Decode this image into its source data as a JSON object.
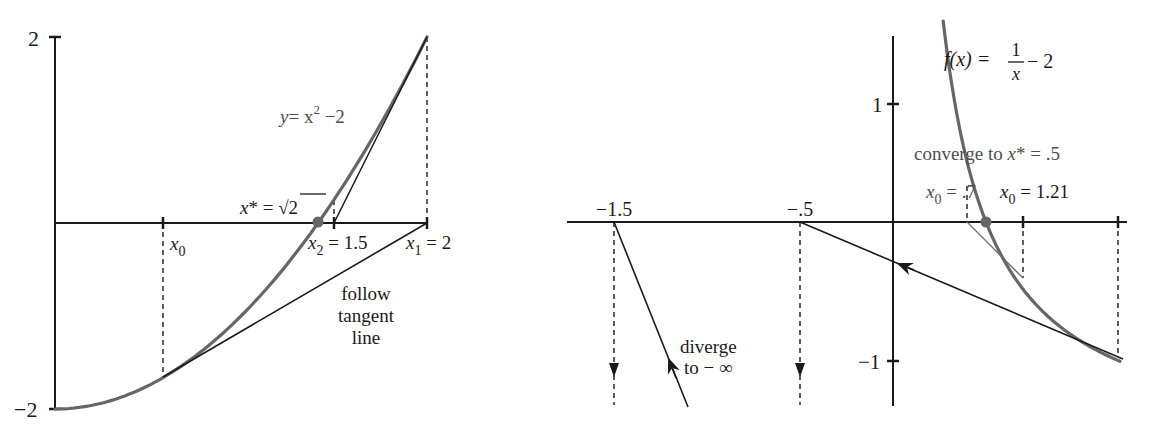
{
  "figure": {
    "left_panel": {
      "title": "Newton's method on y = x^2 - 2",
      "y_ticks": [
        {
          "label": "2",
          "value": 2
        },
        {
          "label": "−2",
          "value": -2
        }
      ],
      "labels": {
        "curve_label_y": "y",
        "curve_label_eq": "= x",
        "curve_label_sup": "2",
        "curve_label_tail": " −2",
        "root_label_x": "x",
        "root_label_star": "* = ",
        "root_label_sqrt": "√",
        "root_label_two": "2",
        "x0_label": "x",
        "x0_sub": "0",
        "x2_label": "x",
        "x2_sub": "2",
        "x2_value": " = 1.5",
        "x1_label": "x",
        "x1_sub": "1",
        "x1_value": " = 2",
        "tangent_note_1": "follow",
        "tangent_note_2": "tangent",
        "tangent_note_3": "line"
      },
      "colors": {
        "curve": "#666666",
        "axis": "#1a1a1a",
        "root_dot": "#666666"
      }
    },
    "right_panel": {
      "title": "Newton's method on f(x) = 1/x - 2",
      "x_tick_labels": [
        {
          "label": "−1.5",
          "value": -1.5
        },
        {
          "label": "−.5",
          "value": -0.5
        }
      ],
      "y_ticks": [
        {
          "label": "1",
          "value": 1
        },
        {
          "label": "−1",
          "value": -1
        }
      ],
      "labels": {
        "func_lhs": "f(x) = ",
        "func_num": "1",
        "func_den": "x",
        "func_tail": " − 2",
        "converge_text": "converge to ",
        "converge_x": "x",
        "converge_val": "* = .5",
        "x0a_label": "x",
        "x0a_sub": "0",
        "x0a_value": " = .7",
        "x0b_label": "x",
        "x0b_sub": "0",
        "x0b_value": " = 1.21",
        "diverge_1": "diverge",
        "diverge_2": "to − ∞"
      },
      "colors": {
        "curve": "#666666",
        "axis": "#1a1a1a",
        "root_dot": "#666666"
      }
    }
  },
  "chart_data": [
    {
      "type": "line",
      "title": "y = x^2 − 2 (Newton's method converging to √2)",
      "xlabel": "",
      "ylabel": "",
      "xlim": [
        0,
        2
      ],
      "ylim": [
        -2,
        2
      ],
      "grid": false,
      "series": [
        {
          "name": "y = x^2 - 2",
          "function": "x^2 - 2",
          "x_range": [
            0,
            2
          ]
        },
        {
          "name": "tangent at x0",
          "x": [
            0.586,
            2
          ],
          "y": [
            -1.657,
            0
          ]
        },
        {
          "name": "tangent at x1",
          "x": [
            2,
            1.5
          ],
          "y": [
            2,
            0
          ]
        }
      ],
      "points": [
        {
          "label": "x0",
          "x": 0.586,
          "y": 0
        },
        {
          "label": "x1 = 2",
          "x": 2,
          "y": 0
        },
        {
          "label": "x2 = 1.5",
          "x": 1.5,
          "y": 0
        },
        {
          "label": "x* = √2",
          "x": 1.414,
          "y": 0
        }
      ],
      "y_ticks": [
        2,
        -2
      ],
      "annotations": [
        "follow tangent line",
        "y = x^2 − 2",
        "x* = √2"
      ]
    },
    {
      "type": "line",
      "title": "f(x) = 1/x − 2 (Newton's method convergence vs divergence)",
      "xlabel": "",
      "ylabel": "",
      "xlim": [
        -1.75,
        1.25
      ],
      "ylim": [
        -1.5,
        1.6
      ],
      "grid": false,
      "series": [
        {
          "name": "f(x) = 1/x - 2",
          "function": "1/x - 2",
          "x_range": [
            0.27,
            1.22
          ]
        },
        {
          "name": "tangent at 1.21",
          "x": [
            1.21,
            -0.5
          ],
          "y": [
            -1.174,
            0
          ]
        },
        {
          "name": "tangent at -0.5 to -1.5",
          "x": [
            -0.5,
            -1.5
          ],
          "y": [
            -4,
            0
          ]
        },
        {
          "name": "tangent at 0.7",
          "x": [
            0.7,
            0.42
          ],
          "y": [
            -0.571,
            0
          ]
        }
      ],
      "points": [
        {
          "label": "x0 = .7",
          "x": 0.7,
          "y": 0
        },
        {
          "label": "x0 = 1.21",
          "x": 1.21,
          "y": 0
        },
        {
          "label": "x* = .5",
          "x": 0.5,
          "y": 0
        },
        {
          "label": "−.5",
          "x": -0.5,
          "y": 0
        },
        {
          "label": "−1.5",
          "x": -1.5,
          "y": 0
        }
      ],
      "y_ticks": [
        1,
        -1
      ],
      "annotations": [
        "converge to x* = .5",
        "diverge to − ∞",
        "f(x) = 1/x − 2"
      ]
    }
  ]
}
